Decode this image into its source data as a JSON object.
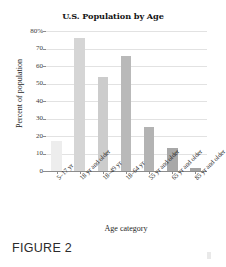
{
  "figure": {
    "caption": "FIGURE 2"
  },
  "chart_data": {
    "type": "bar",
    "title": "U.S. Population by Age",
    "xlabel": "Age category",
    "ylabel": "Percent of population",
    "categories": [
      "5–17 yr",
      "18 yr and older",
      "18–49 yr",
      "18–64 yr",
      "55 yr and older",
      "65 yr and older",
      "85 yr and older"
    ],
    "values": [
      17,
      76,
      54,
      66,
      25,
      13,
      2
    ],
    "ylim": [
      0,
      80
    ],
    "yticks": [
      0,
      10,
      20,
      30,
      40,
      50,
      60,
      70,
      80
    ],
    "ytick_labels": [
      "0",
      "10",
      "20",
      "30",
      "40",
      "50",
      "60",
      "70",
      "80%"
    ],
    "grid": true,
    "legend": "none",
    "bar_colors": [
      "#ededed",
      "#d5d5d5",
      "#cccccc",
      "#b9b9b9",
      "#b3b3b3",
      "#a8a8a8",
      "#a3a3a3"
    ],
    "gridline_color": "#e2e2e2",
    "axis_color": "#8c8c8c"
  }
}
